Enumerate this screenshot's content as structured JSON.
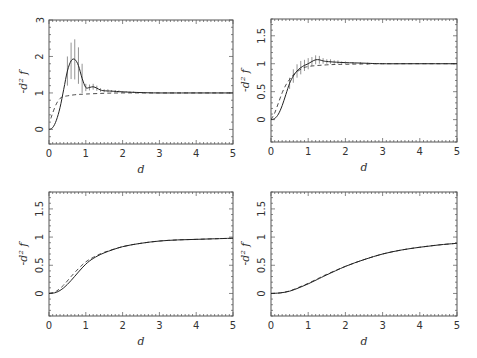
{
  "figure": {
    "panel_count": 4,
    "layout": "2x2 grid"
  },
  "chart_data": [
    {
      "id": "top-left",
      "type": "line",
      "title": "",
      "xlabel": "d",
      "ylabel": "-d² f",
      "xlim": [
        0,
        5
      ],
      "ylim": [
        -0.4,
        3
      ],
      "xticks": [
        0,
        1,
        2,
        3,
        4,
        5
      ],
      "yticks": [
        0,
        1,
        2,
        3
      ],
      "ytick_labels": [
        "0",
        "1",
        "2",
        "3"
      ],
      "grid": false,
      "legend": null,
      "series": [
        {
          "name": "solid (with error bars)",
          "style": "solid",
          "x": [
            0,
            0.1,
            0.2,
            0.3,
            0.4,
            0.5,
            0.6,
            0.7,
            0.8,
            0.9,
            1.0,
            1.1,
            1.2,
            1.3,
            1.4,
            1.5,
            1.7,
            2.0,
            2.5,
            3.0,
            4.0,
            5.0
          ],
          "y": [
            0,
            0.05,
            0.25,
            0.6,
            1.1,
            1.6,
            1.88,
            1.92,
            1.75,
            1.4,
            1.15,
            1.15,
            1.17,
            1.13,
            1.08,
            1.06,
            1.05,
            1.03,
            1.01,
            1.0,
            1.0,
            1.0
          ]
        },
        {
          "name": "dashed",
          "style": "dashed",
          "x": [
            0.05,
            0.1,
            0.2,
            0.3,
            0.4,
            0.5,
            0.7,
            1.0,
            1.5,
            2.0,
            3.0,
            5.0
          ],
          "y": [
            0.3,
            0.45,
            0.7,
            0.85,
            0.9,
            0.92,
            0.95,
            0.97,
            0.99,
            1.0,
            1.0,
            1.0
          ]
        }
      ],
      "error_bars": {
        "x": [
          0.5,
          0.6,
          0.7,
          0.8,
          0.9,
          1.0,
          1.1,
          1.2,
          1.3,
          1.4,
          1.5,
          1.6,
          1.7,
          1.8,
          1.9,
          2.0,
          2.1,
          2.2,
          2.3
        ],
        "y": [
          1.6,
          1.88,
          1.92,
          1.75,
          1.4,
          1.15,
          1.15,
          1.17,
          1.13,
          1.08,
          1.06,
          1.06,
          1.05,
          1.05,
          1.04,
          1.03,
          1.03,
          1.02,
          1.02
        ],
        "err": [
          0.4,
          0.5,
          0.55,
          0.5,
          0.4,
          0.1,
          0.08,
          0.08,
          0.07,
          0.05,
          0.04,
          0.04,
          0.03,
          0.03,
          0.03,
          0.02,
          0.02,
          0.02,
          0.02
        ]
      }
    },
    {
      "id": "top-right",
      "type": "line",
      "title": "",
      "xlabel": "d",
      "ylabel": "-d² f",
      "xlim": [
        0,
        5
      ],
      "ylim": [
        -0.4,
        1.8
      ],
      "xticks": [
        0,
        1,
        2,
        3,
        4,
        5
      ],
      "yticks": [
        0,
        0.5,
        1,
        1.5
      ],
      "ytick_labels": [
        "0",
        "0.5",
        "1",
        "1.5"
      ],
      "grid": false,
      "legend": null,
      "series": [
        {
          "name": "solid (with error bars)",
          "style": "solid",
          "x": [
            0,
            0.1,
            0.2,
            0.3,
            0.4,
            0.5,
            0.6,
            0.7,
            0.8,
            0.9,
            1.0,
            1.1,
            1.2,
            1.3,
            1.4,
            1.5,
            1.7,
            2.0,
            2.5,
            3.0,
            4.0,
            5.0
          ],
          "y": [
            0,
            0.02,
            0.1,
            0.25,
            0.45,
            0.65,
            0.78,
            0.87,
            0.93,
            0.97,
            1.0,
            1.04,
            1.07,
            1.07,
            1.05,
            1.04,
            1.03,
            1.02,
            1.01,
            1.0,
            1.0,
            1.0
          ]
        },
        {
          "name": "dashed",
          "style": "dashed",
          "x": [
            0,
            0.1,
            0.2,
            0.3,
            0.4,
            0.5,
            0.6,
            0.8,
            1.0,
            1.5,
            2.0,
            3.0,
            5.0
          ],
          "y": [
            0,
            0.12,
            0.3,
            0.48,
            0.62,
            0.72,
            0.8,
            0.9,
            0.95,
            0.98,
            0.99,
            1.0,
            1.0
          ]
        }
      ],
      "error_bars": {
        "x": [
          0.5,
          0.6,
          0.7,
          0.8,
          0.9,
          1.0,
          1.1,
          1.2,
          1.3,
          1.4,
          1.5,
          1.6,
          1.7,
          1.8,
          1.9,
          2.0,
          2.2,
          2.4,
          2.6
        ],
        "y": [
          0.65,
          0.78,
          0.87,
          0.93,
          0.97,
          1.0,
          1.04,
          1.07,
          1.07,
          1.05,
          1.04,
          1.04,
          1.03,
          1.03,
          1.02,
          1.02,
          1.01,
          1.01,
          1.0
        ],
        "err": [
          0.1,
          0.12,
          0.12,
          0.12,
          0.1,
          0.1,
          0.08,
          0.08,
          0.07,
          0.05,
          0.04,
          0.04,
          0.03,
          0.03,
          0.02,
          0.02,
          0.02,
          0.02,
          0.02
        ]
      }
    },
    {
      "id": "bottom-left",
      "type": "line",
      "title": "",
      "xlabel": "d",
      "ylabel": "-d² f",
      "xlim": [
        0,
        5
      ],
      "ylim": [
        -0.4,
        1.8
      ],
      "xticks": [
        0,
        1,
        2,
        3,
        4,
        5
      ],
      "yticks": [
        0,
        0.5,
        1,
        1.5
      ],
      "ytick_labels": [
        "0",
        "0.5",
        "1",
        "1.5"
      ],
      "grid": false,
      "legend": null,
      "series": [
        {
          "name": "solid",
          "style": "solid",
          "x": [
            0,
            0.2,
            0.4,
            0.6,
            0.8,
            1.0,
            1.2,
            1.5,
            2.0,
            2.5,
            3.0,
            3.5,
            4.0,
            4.5,
            5.0
          ],
          "y": [
            0,
            0.02,
            0.1,
            0.23,
            0.38,
            0.52,
            0.62,
            0.72,
            0.83,
            0.89,
            0.93,
            0.95,
            0.96,
            0.97,
            0.98
          ]
        },
        {
          "name": "dashed",
          "style": "dashed",
          "x": [
            0,
            0.2,
            0.4,
            0.6,
            0.8,
            1.0,
            1.2,
            1.5,
            2.0,
            2.5,
            3.0,
            3.5,
            4.0,
            4.5,
            5.0
          ],
          "y": [
            0,
            0.04,
            0.15,
            0.3,
            0.44,
            0.56,
            0.64,
            0.73,
            0.83,
            0.89,
            0.93,
            0.95,
            0.96,
            0.97,
            0.98
          ]
        }
      ]
    },
    {
      "id": "bottom-right",
      "type": "line",
      "title": "",
      "xlabel": "d",
      "ylabel": "-d² f",
      "xlim": [
        0,
        5
      ],
      "ylim": [
        -0.4,
        1.8
      ],
      "xticks": [
        0,
        1,
        2,
        3,
        4,
        5
      ],
      "yticks": [
        0,
        0.5,
        1,
        1.5
      ],
      "ytick_labels": [
        "0",
        "0.5",
        "1",
        "1.5"
      ],
      "grid": false,
      "legend": null,
      "series": [
        {
          "name": "solid",
          "style": "solid",
          "x": [
            0,
            0.25,
            0.5,
            0.75,
            1.0,
            1.25,
            1.5,
            2.0,
            2.5,
            3.0,
            3.5,
            4.0,
            4.5,
            5.0
          ],
          "y": [
            0,
            0.01,
            0.04,
            0.1,
            0.17,
            0.25,
            0.33,
            0.48,
            0.6,
            0.7,
            0.77,
            0.82,
            0.86,
            0.89
          ]
        },
        {
          "name": "dashed",
          "style": "dashed",
          "x": [
            0,
            0.25,
            0.5,
            0.75,
            1.0,
            1.25,
            1.5,
            2.0,
            2.5,
            3.0,
            3.5,
            4.0,
            4.5,
            5.0
          ],
          "y": [
            0,
            0.01,
            0.045,
            0.11,
            0.18,
            0.26,
            0.34,
            0.48,
            0.6,
            0.7,
            0.77,
            0.82,
            0.86,
            0.89
          ]
        }
      ]
    }
  ],
  "panel_boxes": [
    {
      "left": 49,
      "top": 20,
      "right": 233,
      "bottom": 144
    },
    {
      "left": 271,
      "top": 19,
      "right": 457,
      "bottom": 142
    },
    {
      "left": 49,
      "top": 192,
      "right": 233,
      "bottom": 316
    },
    {
      "left": 271,
      "top": 192,
      "right": 457,
      "bottom": 316
    }
  ],
  "colors": {
    "axes": "#555555",
    "line": "#222222",
    "errorbar": "#777777",
    "text": "#333333"
  }
}
